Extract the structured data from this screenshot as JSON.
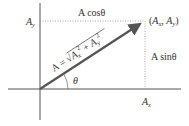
{
  "diagram": {
    "type": "vector-components",
    "colors": {
      "axis": "#555555",
      "vector": "#555555",
      "dotted": "#999999",
      "text": "#333333",
      "background": "#ffffff"
    },
    "labels": {
      "y_component_axis": "A",
      "y_component_axis_sub": "y",
      "x_component_axis": "A",
      "x_component_axis_sub": "x",
      "top_edge": "A cosθ",
      "right_edge": "A sinθ",
      "endpoint_open": "(",
      "endpoint_A1": "A",
      "endpoint_sub1": "x",
      "endpoint_sep": ", ",
      "endpoint_A2": "A",
      "endpoint_sub2": "y",
      "endpoint_close": ")",
      "angle": "θ",
      "magnitude_prefix": "A = √",
      "magnitude_term1": "A",
      "magnitude_term1_sub": "x",
      "magnitude_term1_sup": "2",
      "magnitude_plus": " + ",
      "magnitude_term2": "A",
      "magnitude_term2_sub": "y",
      "magnitude_term2_sup": "2"
    }
  }
}
